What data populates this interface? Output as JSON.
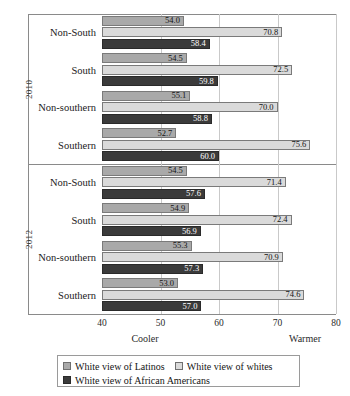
{
  "chart_data": {
    "type": "bar",
    "orientation": "horizontal",
    "title": "",
    "xlabel": "",
    "ylabel": "",
    "xlim": [
      40,
      80
    ],
    "xticks": [
      40,
      50,
      60,
      70,
      80
    ],
    "grid": true,
    "legend_position": "bottom",
    "axis_anchors": {
      "low": "Cooler",
      "high": "Warmer"
    },
    "series": [
      {
        "name": "White view of Latinos",
        "color": "#a9a9a9"
      },
      {
        "name": "White view of whites",
        "color": "#dadada"
      },
      {
        "name": "White view of African Americans",
        "color": "#3b3b3b"
      }
    ],
    "groups": [
      {
        "year": "2010",
        "categories": [
          "Non-South",
          "South",
          "Non-southern",
          "Southern"
        ],
        "values": {
          "White view of Latinos": [
            54.0,
            54.5,
            55.1,
            52.7
          ],
          "White view of whites": [
            70.8,
            72.5,
            70.0,
            75.6
          ],
          "White view of African Americans": [
            58.4,
            59.8,
            58.8,
            60.0
          ]
        }
      },
      {
        "year": "2012",
        "categories": [
          "Non-South",
          "South",
          "Non-southern",
          "Southern"
        ],
        "values": {
          "White view of Latinos": [
            54.5,
            54.9,
            55.3,
            53.0
          ],
          "White view of whites": [
            71.4,
            72.4,
            70.9,
            74.6
          ],
          "White view of African Americans": [
            57.6,
            56.9,
            57.3,
            57.0
          ]
        }
      }
    ]
  },
  "ticks": [
    {
      "label": "40"
    },
    {
      "label": "50"
    },
    {
      "label": "60"
    },
    {
      "label": "70"
    },
    {
      "label": "80"
    }
  ],
  "anchors": {
    "cooler": "Cooler",
    "warmer": "Warmer"
  },
  "legend": {
    "items": [
      {
        "label": "White view of Latinos",
        "swatch": "sw0"
      },
      {
        "label": "White view of whites",
        "swatch": "sw1"
      },
      {
        "label": "White view of African Americans",
        "swatch": "sw2"
      }
    ]
  }
}
